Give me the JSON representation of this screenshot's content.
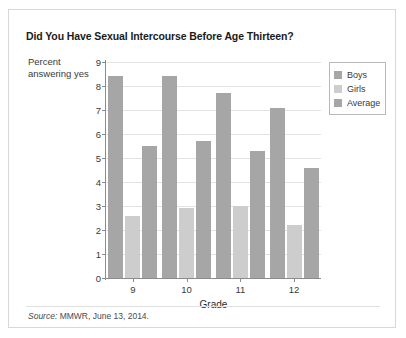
{
  "chart_data": {
    "type": "bar",
    "title": "Did You Have Sexual Intercourse Before Age Thirteen?",
    "categories": [
      "9",
      "10",
      "11",
      "12"
    ],
    "series": [
      {
        "name": "Boys",
        "color": "#a6a6a6",
        "values": [
          8.4,
          8.4,
          7.7,
          7.1
        ]
      },
      {
        "name": "Girls",
        "color": "#cdcdcd",
        "values": [
          2.6,
          2.9,
          3.0,
          2.2
        ]
      },
      {
        "name": "Average",
        "color": "#a6a6a6",
        "values": [
          5.5,
          5.7,
          5.3,
          4.6
        ]
      }
    ],
    "xlabel": "Grade",
    "ylabel": "Percent answering yes",
    "ylim": [
      0,
      9
    ],
    "yticks": [
      0,
      1,
      2,
      3,
      4,
      5,
      6,
      7,
      8,
      9
    ],
    "grid": true,
    "legend_position": "right"
  },
  "legend": {
    "items": [
      {
        "label": "Boys"
      },
      {
        "label": "Girls"
      },
      {
        "label": "Average"
      }
    ]
  },
  "footer": {
    "source_label": "Source:",
    "source_text": " MMWR, June 13, 2014."
  }
}
